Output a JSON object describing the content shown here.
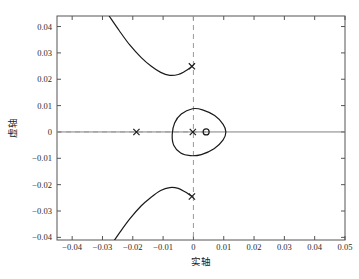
{
  "chart_data": {
    "type": "scatter",
    "title": "",
    "xlabel": "实轴",
    "ylabel": "虚轴",
    "xlim": [
      -0.045,
      0.05
    ],
    "ylim": [
      -0.041,
      0.044
    ],
    "grid": false,
    "legend": null,
    "xticks": [
      "-0.04",
      "-0.03",
      "-0.02",
      "-0.01",
      "0",
      "0.01",
      "0.02",
      "0.03",
      "0.04",
      "0.05"
    ],
    "xtick_values": [
      -0.04,
      -0.03,
      -0.02,
      -0.01,
      0,
      0.01,
      0.02,
      0.03,
      0.04,
      0.05
    ],
    "yticks": [
      "0.04",
      "0.03",
      "0.02",
      "0.01",
      "0",
      "-0.01",
      "-0.02",
      "-0.03",
      "-0.04"
    ],
    "ytick_values": [
      0.04,
      0.03,
      0.02,
      0.01,
      0,
      -0.01,
      -0.02,
      -0.03,
      -0.04
    ],
    "series": [
      {
        "name": "poles",
        "marker": "x",
        "points": [
          {
            "x": -0.0188,
            "y": 0.0
          },
          {
            "x": -0.0002,
            "y": 0.0
          },
          {
            "x": -0.0005,
            "y": 0.0249
          },
          {
            "x": -0.0005,
            "y": -0.0245
          }
        ]
      },
      {
        "name": "zeros",
        "marker": "o",
        "points": [
          {
            "x": 0.0042,
            "y": 0.0
          }
        ]
      },
      {
        "name": "locus-loop",
        "marker": "line",
        "points": [
          {
            "x": -0.0003,
            "y": 0.0088
          },
          {
            "x": 0.003,
            "y": 0.0084
          },
          {
            "x": 0.007,
            "y": 0.0062
          },
          {
            "x": 0.0098,
            "y": 0.0029
          },
          {
            "x": 0.0107,
            "y": 0.0
          },
          {
            "x": 0.0098,
            "y": -0.003
          },
          {
            "x": 0.0068,
            "y": -0.0064
          },
          {
            "x": 0.0026,
            "y": -0.0086
          },
          {
            "x": -0.001,
            "y": -0.009
          },
          {
            "x": -0.0042,
            "y": -0.008
          },
          {
            "x": -0.0065,
            "y": -0.005
          },
          {
            "x": -0.007,
            "y": -0.001
          },
          {
            "x": -0.0062,
            "y": 0.0034
          },
          {
            "x": -0.004,
            "y": 0.0068
          },
          {
            "x": -0.0003,
            "y": 0.0088
          }
        ]
      },
      {
        "name": "locus-upper-branch",
        "marker": "line",
        "points": [
          {
            "x": -0.0278,
            "y": 0.044
          },
          {
            "x": -0.0245,
            "y": 0.0385
          },
          {
            "x": -0.021,
            "y": 0.033
          },
          {
            "x": -0.0172,
            "y": 0.0282
          },
          {
            "x": -0.014,
            "y": 0.025
          },
          {
            "x": -0.0108,
            "y": 0.0226
          },
          {
            "x": -0.0078,
            "y": 0.0215
          },
          {
            "x": -0.005,
            "y": 0.0218
          },
          {
            "x": -0.0028,
            "y": 0.023
          },
          {
            "x": -0.0012,
            "y": 0.0242
          },
          {
            "x": -0.0005,
            "y": 0.0249
          }
        ]
      },
      {
        "name": "locus-lower-branch",
        "marker": "line",
        "points": [
          {
            "x": -0.0278,
            "y": -0.044
          },
          {
            "x": -0.0245,
            "y": -0.0385
          },
          {
            "x": -0.021,
            "y": -0.033
          },
          {
            "x": -0.0172,
            "y": -0.028
          },
          {
            "x": -0.014,
            "y": -0.0248
          },
          {
            "x": -0.0108,
            "y": -0.0222
          },
          {
            "x": -0.0078,
            "y": -0.0211
          },
          {
            "x": -0.005,
            "y": -0.0214
          },
          {
            "x": -0.0028,
            "y": -0.0227
          },
          {
            "x": -0.0012,
            "y": -0.0239
          },
          {
            "x": -0.0005,
            "y": -0.0245
          }
        ]
      },
      {
        "name": "real-axis-locus",
        "marker": "line",
        "points": [
          {
            "x": -0.045,
            "y": 0.0
          },
          {
            "x": 0.05,
            "y": 0.0
          }
        ]
      }
    ],
    "dashed_real_axis_segment": {
      "from": -0.045,
      "to": 0.0042,
      "y": 0.0
    },
    "dashed_imag_axis": {
      "x": 0.0,
      "from": -0.041,
      "to": 0.044
    },
    "colors": {
      "curve": "#1a1a1a",
      "axis": "#808080",
      "dashed": "#999999",
      "frame": "#555555",
      "background": "#ffffff"
    }
  }
}
